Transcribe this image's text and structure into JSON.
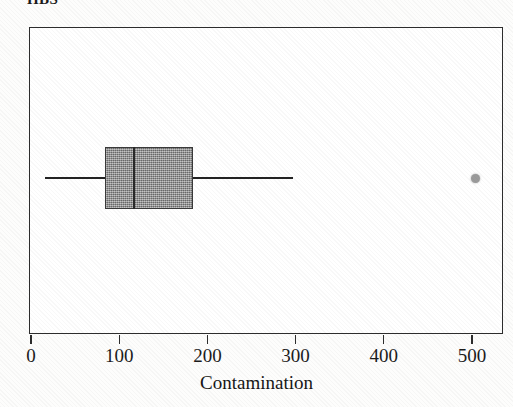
{
  "figure": {
    "title": "HBS",
    "title_note": "clipped at top edge of image"
  },
  "axis": {
    "x_label": "Contamination",
    "x_ticks": [
      "0",
      "100",
      "200",
      "300",
      "400",
      "500"
    ]
  },
  "chart_data": {
    "type": "box",
    "title": "HBS",
    "xlabel": "Contamination",
    "ylabel": "",
    "orientation": "horizontal",
    "xlim": [
      -19,
      537
    ],
    "x_ticks": [
      0,
      100,
      200,
      300,
      400,
      500
    ],
    "grid": false,
    "legend": null,
    "boxes": [
      {
        "name": "Contamination",
        "whisker_low": 15,
        "q1": 83,
        "median": 116,
        "q3": 183,
        "whisker_high": 296,
        "outliers": [
          503
        ],
        "box_fill": "#8c8c8c",
        "box_edge": "#3a3a3a",
        "outlier_color": "#9a9a9a"
      }
    ]
  },
  "colors": {
    "background": "#fdfdfc",
    "plot_background": "#ffffff",
    "frame": "#2d2d2d",
    "line": "#232323",
    "box_fill": "#8c8c8c",
    "outlier": "#9a9a9a",
    "text": "#1c1c1c"
  }
}
